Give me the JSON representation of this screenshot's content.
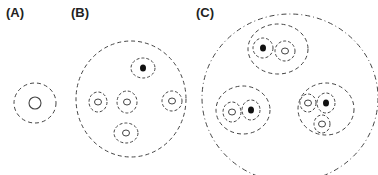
{
  "panels": [
    {
      "label": "(A)",
      "label_pos": [
        6,
        17
      ],
      "outer": {
        "cx": 35,
        "cy": 103,
        "rx": 21,
        "ry": 20,
        "style": "dashed"
      },
      "inner": {
        "cx": 35,
        "cy": 103,
        "r": 6,
        "style": "solid"
      }
    },
    {
      "label": "(B)",
      "label_pos": [
        71,
        17
      ],
      "outer": {
        "cx": 131,
        "cy": 99,
        "rx": 55,
        "ry": 58,
        "style": "dashed"
      },
      "units": [
        {
          "cx": 143,
          "cy": 68,
          "rx": 12,
          "ry": 10,
          "core": "filled"
        },
        {
          "cx": 98,
          "cy": 102,
          "rx": 9,
          "ry": 10,
          "core": "open"
        },
        {
          "cx": 127,
          "cy": 102,
          "rx": 10,
          "ry": 11,
          "core": "open"
        },
        {
          "cx": 172,
          "cy": 101,
          "rx": 10,
          "ry": 10,
          "core": "open"
        },
        {
          "cx": 126,
          "cy": 133,
          "rx": 12,
          "ry": 10,
          "core": "open"
        }
      ]
    },
    {
      "label": "(C)",
      "label_pos": [
        196,
        17
      ],
      "outer": {
        "cx": 290,
        "cy": 98,
        "rx": 88,
        "ry": 84,
        "style": "dash-dot"
      },
      "groups": [
        {
          "cx": 278,
          "cy": 49,
          "rx": 30,
          "ry": 25,
          "units": [
            {
              "cx": 263,
              "cy": 48,
              "rx": 10,
              "ry": 10,
              "core": "filled"
            },
            {
              "cx": 285,
              "cy": 51,
              "rx": 10,
              "ry": 10,
              "core": "open"
            }
          ]
        },
        {
          "cx": 243,
          "cy": 110,
          "rx": 27,
          "ry": 24,
          "units": [
            {
              "cx": 232,
              "cy": 112,
              "rx": 9,
              "ry": 10,
              "core": "open"
            },
            {
              "cx": 251,
              "cy": 110,
              "rx": 9,
              "ry": 10,
              "core": "filled"
            }
          ]
        },
        {
          "cx": 326,
          "cy": 109,
          "rx": 28,
          "ry": 26,
          "units": [
            {
              "cx": 308,
              "cy": 103,
              "rx": 8,
              "ry": 9,
              "core": "open"
            },
            {
              "cx": 326,
              "cy": 103,
              "rx": 9,
              "ry": 10,
              "core": "filled"
            },
            {
              "cx": 322,
              "cy": 124,
              "rx": 8,
              "ry": 9,
              "core": "open"
            }
          ]
        }
      ]
    }
  ],
  "colors": {
    "stroke": "#444444",
    "fill_core": "#111111",
    "background": "#ffffff"
  }
}
